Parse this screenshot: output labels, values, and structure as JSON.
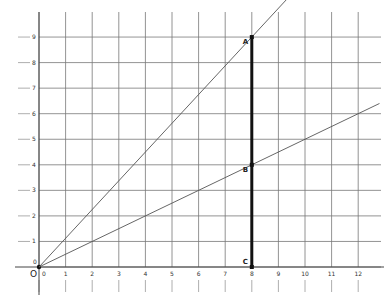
{
  "diagram": {
    "type": "coordinate-grid",
    "origin_label": "O",
    "x_axis": {
      "ticks": [
        "0",
        "1",
        "2",
        "3",
        "4",
        "5",
        "6",
        "7",
        "8",
        "9",
        "10",
        "11",
        "12"
      ]
    },
    "y_axis": {
      "ticks": [
        "0",
        "1",
        "2",
        "3",
        "4",
        "5",
        "6",
        "7",
        "8",
        "9"
      ]
    },
    "lines": [
      {
        "name": "line-OA",
        "from": [
          0,
          0
        ],
        "through": [
          8,
          9
        ]
      },
      {
        "name": "line-OB",
        "from": [
          0,
          0
        ],
        "through": [
          8,
          4
        ]
      },
      {
        "name": "segment-CA",
        "from": [
          8,
          0
        ],
        "to": [
          8,
          9
        ],
        "thick": true
      }
    ],
    "points": [
      {
        "label": "A",
        "x": 8,
        "y": 9
      },
      {
        "label": "B",
        "x": 8,
        "y": 4
      },
      {
        "label": "C",
        "x": 8,
        "y": 0
      }
    ],
    "colors": {
      "grid": "#777777",
      "line": "#555555",
      "segment": "#111111"
    }
  }
}
